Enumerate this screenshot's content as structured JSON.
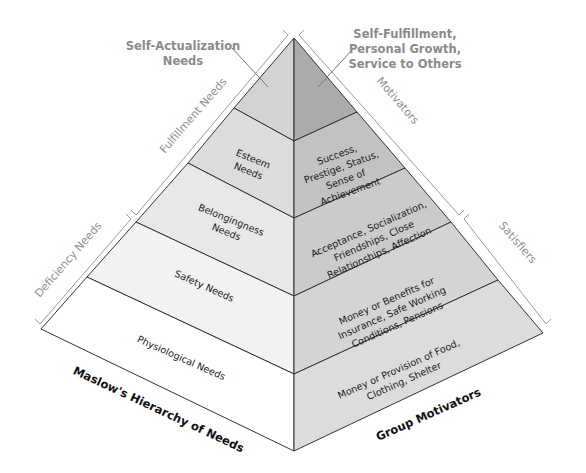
{
  "diagram": {
    "type": "hierarchy-pyramid",
    "colors": {
      "outline": "#333333",
      "bracket": "#9a9a9a",
      "callout_text": "#8a8a8a",
      "left_top": "#d3d3d3",
      "left_esteem": "#dcdcdc",
      "left_belonging": "#e8e8e8",
      "left_safety": "#f2f2f2",
      "left_physiological": "#ffffff",
      "right_top": "#ababab",
      "right_esteem": "#c2c2c2",
      "right_belonging": "#cbcbcb",
      "right_safety": "#d4d4d4",
      "right_physiological": "#dcdcdc"
    },
    "left_face": {
      "title": "Maslow's Hierarchy of Needs",
      "tiers": [
        {
          "lines": [
            "Self-Actualization",
            "Needs"
          ]
        },
        {
          "lines": [
            "Esteem",
            "Needs"
          ]
        },
        {
          "lines": [
            "Belongingness",
            "Needs"
          ]
        },
        {
          "lines": [
            "Safety Needs"
          ]
        },
        {
          "lines": [
            "Physiological Needs"
          ]
        }
      ]
    },
    "right_face": {
      "title": "Group Motivators",
      "tiers": [
        {
          "lines": [
            "Self-Fulfillment,",
            "Personal Growth,",
            "Service to Others"
          ]
        },
        {
          "lines": [
            "Success,",
            "Prestige, Status,",
            "Sense of",
            "Achievement"
          ]
        },
        {
          "lines": [
            "Acceptance, Socialization,",
            "Friendships, Close",
            "Relationships, Affection"
          ]
        },
        {
          "lines": [
            "Money or Benefits for",
            "Insurance, Safe Working",
            "Conditions, Pensions"
          ]
        },
        {
          "lines": [
            "Money or Provision of Food,",
            "Clothing, Shelter"
          ]
        }
      ]
    },
    "brackets": {
      "left_upper": "Fulfillment Needs",
      "left_lower": "Deficiency Needs",
      "right_upper": "Motivators",
      "right_lower": "Satisfiers"
    }
  }
}
